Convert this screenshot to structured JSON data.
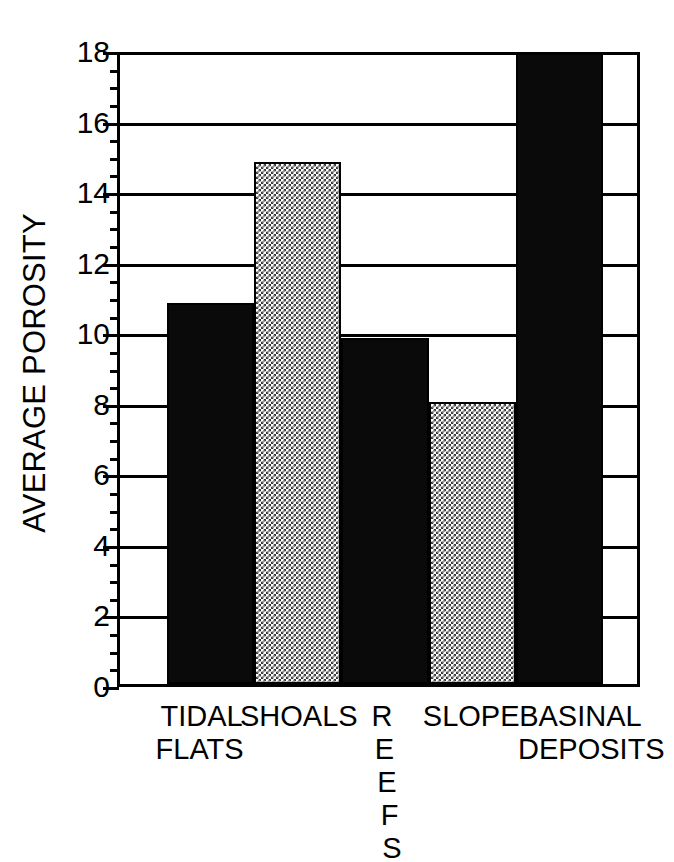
{
  "chart_data": {
    "type": "bar",
    "title": "",
    "xlabel": "",
    "ylabel": "AVERAGE POROSITY",
    "categories": [
      "TIDAL FLATS",
      "SHOALS",
      "REEFS",
      "SLOPE",
      "BASINAL DEPOSITS"
    ],
    "category_lines": [
      [
        "TIDAL",
        "FLATS"
      ],
      [
        "SHOALS"
      ],
      [
        "R",
        "E",
        "E",
        "F",
        "S"
      ],
      [
        "SLOPE"
      ],
      [
        "BASINAL",
        "DEPOSITS"
      ]
    ],
    "values": [
      10.8,
      14.8,
      9.8,
      8.0,
      17.9
    ],
    "bar_fills": [
      "solid",
      "dither",
      "solid",
      "dither",
      "solid"
    ],
    "ylim": [
      0,
      18
    ],
    "yticks": [
      0,
      2,
      4,
      6,
      8,
      10,
      12,
      14,
      16,
      18
    ],
    "ytick_labels": [
      "0",
      "2",
      "4",
      "6",
      "8",
      "10",
      "12",
      "14",
      "16",
      "18"
    ],
    "minor_tick_step": 0.5,
    "grid": true,
    "grid_axis": "y",
    "legend": "none",
    "colors": {
      "solid_fill": "#0a0a0a",
      "dither_fill": "#3a3a3a",
      "axis": "#000000",
      "background": "#ffffff"
    }
  }
}
